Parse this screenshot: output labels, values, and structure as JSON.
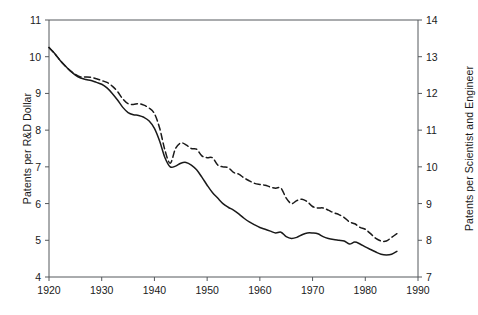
{
  "chart_data": {
    "type": "line",
    "title": "",
    "xlabel": "",
    "ylabel": "Patents per R&D Dollar",
    "y2label": "Patents per Scientist and Engineer",
    "xlim": [
      1920,
      1990
    ],
    "ylim": [
      4,
      11
    ],
    "y2lim": [
      7,
      14
    ],
    "grid": false,
    "legend": "none",
    "xticks": [
      1920,
      1930,
      1940,
      1950,
      1960,
      1970,
      1980,
      1990
    ],
    "xtick_labels": [
      "1920",
      "1930",
      "1940",
      "1950",
      "1960",
      "1970",
      "1980",
      "1990"
    ],
    "yticks": [
      4,
      5,
      6,
      7,
      8,
      9,
      10,
      11
    ],
    "ytick_labels": [
      "4",
      "5",
      "6",
      "7",
      "8",
      "9",
      "10",
      "11"
    ],
    "y2ticks": [
      7,
      8,
      9,
      10,
      11,
      12,
      13,
      14
    ],
    "y2tick_labels": [
      "7",
      "8",
      "9",
      "10",
      "11",
      "12",
      "13",
      "14"
    ],
    "series": [
      {
        "name": "Patents per R&D Dollar",
        "axis": "left",
        "style": "solid",
        "color": "#1a1a1a",
        "x": [
          1920,
          1921,
          1922,
          1923,
          1924,
          1925,
          1926,
          1927,
          1928,
          1929,
          1930,
          1931,
          1932,
          1933,
          1934,
          1935,
          1936,
          1937,
          1938,
          1939,
          1940,
          1941,
          1942,
          1943,
          1944,
          1945,
          1946,
          1947,
          1948,
          1949,
          1950,
          1951,
          1952,
          1953,
          1954,
          1955,
          1956,
          1957,
          1958,
          1959,
          1960,
          1961,
          1962,
          1963,
          1964,
          1965,
          1966,
          1967,
          1968,
          1969,
          1970,
          1971,
          1972,
          1973,
          1974,
          1975,
          1976,
          1977,
          1978,
          1979,
          1980,
          1981,
          1982,
          1983,
          1984,
          1985,
          1986
        ],
        "y": [
          10.25,
          10.1,
          9.92,
          9.76,
          9.62,
          9.5,
          9.42,
          9.38,
          9.35,
          9.3,
          9.25,
          9.15,
          9.0,
          8.82,
          8.62,
          8.48,
          8.42,
          8.4,
          8.35,
          8.25,
          8.05,
          7.7,
          7.25,
          7.0,
          7.02,
          7.1,
          7.12,
          7.05,
          6.92,
          6.72,
          6.5,
          6.3,
          6.15,
          6.0,
          5.9,
          5.82,
          5.72,
          5.6,
          5.5,
          5.42,
          5.35,
          5.3,
          5.25,
          5.2,
          5.22,
          5.1,
          5.05,
          5.08,
          5.15,
          5.2,
          5.2,
          5.18,
          5.1,
          5.05,
          5.02,
          5.0,
          4.98,
          4.9,
          4.95,
          4.9,
          4.82,
          4.75,
          4.68,
          4.62,
          4.6,
          4.62,
          4.7
        ]
      },
      {
        "name": "Patents per Scientist and Engineer",
        "axis": "right",
        "style": "dashed",
        "color": "#1a1a1a",
        "x": [
          1920,
          1921,
          1922,
          1923,
          1924,
          1925,
          1926,
          1927,
          1928,
          1929,
          1930,
          1931,
          1932,
          1933,
          1934,
          1935,
          1936,
          1937,
          1938,
          1939,
          1940,
          1941,
          1942,
          1943,
          1944,
          1945,
          1946,
          1947,
          1948,
          1949,
          1950,
          1951,
          1952,
          1953,
          1954,
          1955,
          1956,
          1957,
          1958,
          1959,
          1960,
          1961,
          1962,
          1963,
          1964,
          1965,
          1966,
          1967,
          1968,
          1969,
          1970,
          1971,
          1972,
          1973,
          1974,
          1975,
          1976,
          1977,
          1978,
          1979,
          1980,
          1981,
          1982,
          1983,
          1984,
          1985,
          1986
        ],
        "y": [
          13.25,
          13.1,
          12.92,
          12.76,
          12.62,
          12.52,
          12.45,
          12.45,
          12.44,
          12.4,
          12.35,
          12.3,
          12.2,
          12.05,
          11.85,
          11.72,
          11.7,
          11.72,
          11.68,
          11.6,
          11.45,
          11.05,
          10.45,
          10.1,
          10.5,
          10.65,
          10.6,
          10.5,
          10.48,
          10.3,
          10.25,
          10.25,
          10.05,
          10.0,
          9.98,
          9.85,
          9.8,
          9.7,
          9.62,
          9.55,
          9.52,
          9.5,
          9.45,
          9.42,
          9.42,
          9.15,
          9.0,
          9.08,
          9.12,
          9.05,
          8.92,
          8.88,
          8.88,
          8.82,
          8.75,
          8.7,
          8.62,
          8.5,
          8.45,
          8.35,
          8.3,
          8.18,
          8.05,
          7.98,
          7.98,
          8.08,
          8.18
        ]
      }
    ]
  },
  "axes": {
    "left_title": "Patents per R&D Dollar",
    "right_title": "Patents per Scientist and Engineer"
  }
}
